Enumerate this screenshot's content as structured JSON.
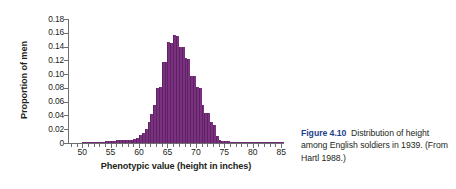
{
  "axes": {
    "y_title": "Proportion of men",
    "x_title": "Phenotypic value (height in inches)",
    "y_ticks": [
      "0.18",
      "0.16",
      "0.14",
      "0.12",
      "0.10",
      "0.08",
      "0.06",
      "0.04",
      "0.02",
      "0"
    ],
    "x_ticks": [
      "50",
      "55",
      "60",
      "65",
      "70",
      "75",
      "80",
      "85"
    ]
  },
  "caption": {
    "figure_number": "Figure 4.10",
    "text": "Distribution of height among English soldiers in 1939. (From Hartl 1988.)"
  },
  "colors": {
    "bar": "#7b3080",
    "bar_edge": "#5d2463",
    "axis": "#6d6e71",
    "text": "#231f20",
    "figure_number": "#1d3f8c"
  },
  "chart_data": {
    "type": "bar",
    "title": "Distribution of height among English soldiers in 1939",
    "xlabel": "Phenotypic value (height in inches)",
    "ylabel": "Proportion of men",
    "xlim": [
      47.5,
      85.5
    ],
    "ylim": [
      0,
      0.18
    ],
    "bin_width": 0.5,
    "grid": false,
    "legend": null,
    "categories": [
      48.0,
      48.5,
      49.0,
      49.5,
      50.0,
      50.5,
      51.0,
      51.5,
      52.0,
      52.5,
      53.0,
      53.5,
      54.0,
      54.5,
      55.0,
      55.5,
      56.0,
      56.5,
      57.0,
      57.5,
      58.0,
      58.5,
      59.0,
      59.5,
      60.0,
      60.5,
      61.0,
      61.5,
      62.0,
      62.5,
      63.0,
      63.5,
      64.0,
      64.5,
      65.0,
      65.5,
      66.0,
      66.5,
      67.0,
      67.5,
      68.0,
      68.5,
      69.0,
      69.5,
      70.0,
      70.5,
      71.0,
      71.5,
      72.0,
      72.5,
      73.0,
      73.5,
      74.0,
      74.5,
      75.0,
      75.5,
      76.0,
      76.5,
      77.0,
      77.5,
      78.0,
      78.5,
      79.0,
      79.5,
      80.0,
      80.5,
      81.0,
      81.5,
      82.0,
      82.5,
      83.0,
      83.5,
      84.0,
      84.5,
      85.0
    ],
    "values": [
      0.0,
      0.0,
      0.0,
      0.0,
      0.001,
      0.001,
      0.002,
      0.002,
      0.002,
      0.002,
      0.002,
      0.002,
      0.003,
      0.003,
      0.003,
      0.003,
      0.004,
      0.004,
      0.004,
      0.004,
      0.005,
      0.005,
      0.006,
      0.008,
      0.011,
      0.015,
      0.021,
      0.03,
      0.042,
      0.055,
      0.08,
      0.081,
      0.118,
      0.117,
      0.146,
      0.145,
      0.157,
      0.156,
      0.14,
      0.139,
      0.123,
      0.122,
      0.098,
      0.097,
      0.081,
      0.08,
      0.055,
      0.044,
      0.043,
      0.03,
      0.026,
      0.01,
      0.004,
      0.003,
      0.003,
      0.003,
      0.002,
      0.002,
      0.002,
      0.002,
      0.002,
      0.001,
      0.001,
      0.001,
      0.002,
      0.002,
      0.001,
      0.001,
      0.001,
      0.001,
      0.001,
      0.001,
      0.001,
      0.001,
      0.001
    ]
  }
}
